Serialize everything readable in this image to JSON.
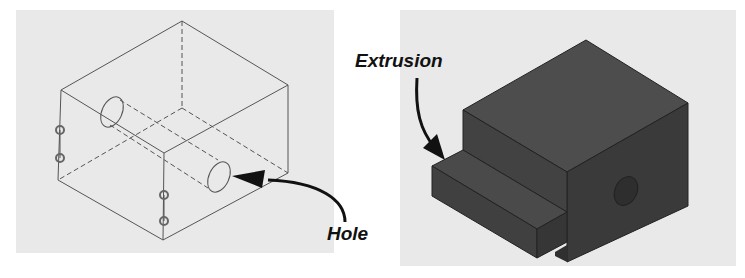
{
  "figure": {
    "left": {
      "description": "Wireframe isometric block with through hole and small side holes",
      "callout": {
        "label": "Hole",
        "color": "#111111"
      }
    },
    "right": {
      "description": "Shaded isometric solid block with extruded step and hole",
      "callout": {
        "label": "Extrusion",
        "color": "#111111"
      }
    },
    "colors": {
      "panel_bg": "#e9e9e9",
      "wire": "#555555",
      "solid_top": "#4a4a4a",
      "solid_left": "#3f3f3f",
      "solid_right": "#383838"
    }
  }
}
